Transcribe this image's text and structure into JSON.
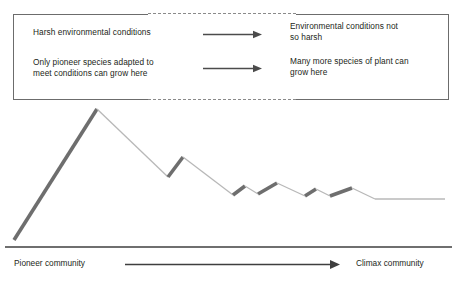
{
  "info_box": {
    "left_column": [
      {
        "text": "Harsh environmental conditions"
      },
      {
        "text": "Only pioneer species adapted to\nmeet conditions can grow here"
      }
    ],
    "right_column": [
      {
        "text": "Environmental conditions not\nso harsh"
      },
      {
        "text": "Many more species of plant can\ngrow here"
      }
    ],
    "arrow_icon": "right-arrow-icon",
    "border_color": "#6c6c6c",
    "dashed_segment_color": "#8a8a8a"
  },
  "axis": {
    "left_label": "Pioneer community",
    "right_label": "Climax community",
    "arrow_icon": "right-arrow-icon",
    "line_color": "#3f3f3f"
  },
  "chart_data": {
    "type": "line",
    "title": "",
    "xlabel": "",
    "ylabel": "",
    "grid": false,
    "legend": null,
    "annotations": [
      "Rising (thick dark) strokes represent colonisation / growth phases",
      "Falling (thin light) strokes represent decline phases"
    ],
    "series": [
      {
        "name": "Species diversity",
        "points": [
          {
            "x": 14,
            "y": 240,
            "kind": "start"
          },
          {
            "x": 97,
            "y": 109,
            "kind": "peak"
          },
          {
            "x": 168,
            "y": 177,
            "kind": "trough"
          },
          {
            "x": 183,
            "y": 157,
            "kind": "peak"
          },
          {
            "x": 233,
            "y": 195,
            "kind": "trough"
          },
          {
            "x": 245,
            "y": 186,
            "kind": "peak"
          },
          {
            "x": 258,
            "y": 194,
            "kind": "trough"
          },
          {
            "x": 277,
            "y": 183,
            "kind": "peak"
          },
          {
            "x": 305,
            "y": 196,
            "kind": "trough"
          },
          {
            "x": 316,
            "y": 189,
            "kind": "peak"
          },
          {
            "x": 330,
            "y": 196,
            "kind": "trough"
          },
          {
            "x": 352,
            "y": 188,
            "kind": "peak"
          },
          {
            "x": 375,
            "y": 199,
            "kind": "trough"
          },
          {
            "x": 445,
            "y": 199,
            "kind": "end"
          }
        ]
      }
    ],
    "stroke_rising_color": "#6e6e6e",
    "stroke_falling_color": "#b8b8b8",
    "baseline_y": 247,
    "baseline_x_range": [
      5,
      452
    ]
  }
}
